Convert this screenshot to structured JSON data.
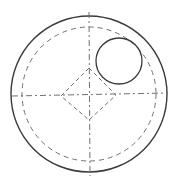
{
  "diagram": {
    "type": "technical-drawing",
    "colors": {
      "stroke": "#3a3a3a",
      "dashed": "#707070",
      "background": "#ffffff"
    },
    "outer_circle": {
      "cx": 89,
      "cy": 94,
      "r": 78
    },
    "dashed_circle": {
      "cx": 89,
      "cy": 94,
      "r": 67
    },
    "small_circle": {
      "cx": 119,
      "cy": 61,
      "r": 23
    },
    "diamond": {
      "points": "89,68 116,95 89,120 61,96"
    },
    "center_lines": {
      "horizontal": {
        "x1": 12,
        "y1": 96,
        "x2": 168,
        "y2": 93
      },
      "vertical": {
        "x1": 89,
        "y1": 12,
        "x2": 90,
        "y2": 176
      }
    }
  }
}
